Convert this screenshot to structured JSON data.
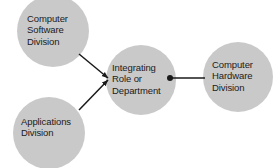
{
  "diagram": {
    "type": "node-link-diagram",
    "background_color": "#ffffff",
    "node_fill_color": "#c9c9c9",
    "connector_color": "#1a1a1a",
    "text_color": "#1b1b1b",
    "nodes": [
      {
        "id": "computer-software-division",
        "label": "Computer\nSoftware\nDivision",
        "line1": "Computer",
        "line2": "Software",
        "line3": "Division",
        "cx": 53,
        "cy": 31,
        "r": 36
      },
      {
        "id": "applications-division",
        "label": "Applications\nDivision",
        "line1": "Applications",
        "line2": "Division",
        "cx": 49,
        "cy": 133,
        "r": 36
      },
      {
        "id": "integrating-role-or-department",
        "label": "Integrating\nRole or\nDepartment",
        "line1": "Integrating",
        "line2": "Role or",
        "line3": "Department",
        "cx": 141,
        "cy": 80,
        "r": 35
      },
      {
        "id": "computer-hardware-division",
        "label": "Computer\nHardware\nDivision",
        "line1": "Computer",
        "line2": "Hardware",
        "line3": "Division",
        "cx": 238,
        "cy": 77,
        "r": 35
      }
    ],
    "connectors": [
      {
        "id": "software-to-integrating",
        "from": "computer-software-division",
        "to": "integrating-role-or-department",
        "style": "arrow",
        "x1": 79,
        "y1": 54,
        "x2": 108,
        "y2": 78
      },
      {
        "id": "applications-to-integrating",
        "from": "applications-division",
        "to": "integrating-role-or-department",
        "style": "arrow",
        "x1": 79,
        "y1": 110,
        "x2": 108,
        "y2": 80
      },
      {
        "id": "integrating-to-hardware",
        "from": "integrating-role-or-department",
        "to": "computer-hardware-division",
        "style": "line-with-dot",
        "x1": 169,
        "y1": 78,
        "x2": 205,
        "y2": 78,
        "dot_x": 170,
        "dot_y": 78,
        "dot_r": 3
      }
    ]
  }
}
